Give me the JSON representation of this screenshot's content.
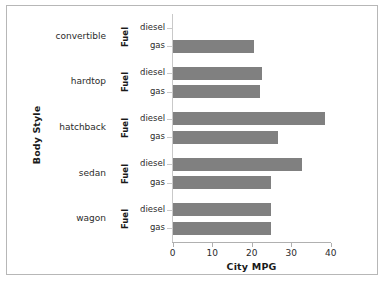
{
  "chart_data": {
    "type": "bar",
    "orientation": "horizontal",
    "title": "",
    "xlabel": "City MPG",
    "ylabel": "Body Style",
    "group_axis_label": "Fuel",
    "xlim": [
      0,
      40
    ],
    "xticks": [
      0,
      10,
      20,
      30,
      40
    ],
    "xtick_labels": [
      "0",
      "10",
      "20",
      "30",
      "40"
    ],
    "grid": false,
    "legend": "none",
    "bar_color": "#808080",
    "categories": [
      "convertible",
      "hardtop",
      "hatchback",
      "sedan",
      "wagon"
    ],
    "subcategories": [
      "diesel",
      "gas"
    ],
    "groups": [
      {
        "category": "convertible",
        "fuel_axis_label": "Fuel",
        "bars": [
          {
            "fuel": "diesel",
            "value": null,
            "value_label": ""
          },
          {
            "fuel": "gas",
            "value": 20.4,
            "value_label": "20.4"
          }
        ]
      },
      {
        "category": "hardtop",
        "fuel_axis_label": "Fuel",
        "bars": [
          {
            "fuel": "diesel",
            "value": 22.5,
            "value_label": "22.5"
          },
          {
            "fuel": "gas",
            "value": 21.9,
            "value_label": "21.9"
          }
        ]
      },
      {
        "category": "hatchback",
        "fuel_axis_label": "Fuel",
        "bars": [
          {
            "fuel": "diesel",
            "value": 38.4,
            "value_label": "38.4"
          },
          {
            "fuel": "gas",
            "value": 26.6,
            "value_label": "26.6"
          }
        ]
      },
      {
        "category": "sedan",
        "fuel_axis_label": "Fuel",
        "bars": [
          {
            "fuel": "diesel",
            "value": 32.7,
            "value_label": "32.7"
          },
          {
            "fuel": "gas",
            "value": 24.9,
            "value_label": "24.9"
          }
        ]
      },
      {
        "category": "wagon",
        "fuel_axis_label": "Fuel",
        "bars": [
          {
            "fuel": "diesel",
            "value": 24.7,
            "value_label": "24.7"
          },
          {
            "fuel": "gas",
            "value": 24.8,
            "value_label": "24.8"
          }
        ]
      }
    ]
  }
}
